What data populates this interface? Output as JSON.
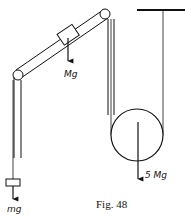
{
  "figure": {
    "caption": "Fig. 48",
    "labels": {
      "block_on_incline_weight": "Mg",
      "hanging_mass_weight": "mg",
      "pulley_weight": "5 Mg"
    },
    "elements": [
      "inclined tube with pulleys at both ends",
      "block M on incline",
      "left vertical tube with hanging mass m",
      "large movable pulley supported from ceiling",
      "ceiling"
    ],
    "colors": {
      "ink": "#111111",
      "background": "#ffffff"
    }
  }
}
